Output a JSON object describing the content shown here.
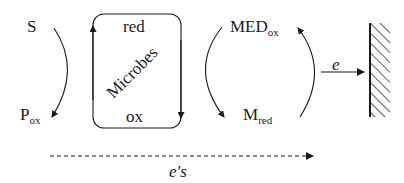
{
  "diagram": {
    "substrate": {
      "label": "S"
    },
    "product": {
      "label": "P",
      "subscript": "ox"
    },
    "microbes_box": {
      "title": "Microbes",
      "top_label": "red",
      "bottom_label": "ox"
    },
    "mediator_oxidized": {
      "label": "MED",
      "subscript": "ox"
    },
    "mediator_reduced": {
      "label": "M",
      "subscript": "red"
    },
    "electron_to_electrode": {
      "label": "e"
    },
    "electrode": {
      "label": ""
    },
    "electron_flow": {
      "label": "e's"
    },
    "colors": {
      "stroke": "#1a1a1a",
      "background": "#ffffff"
    }
  }
}
